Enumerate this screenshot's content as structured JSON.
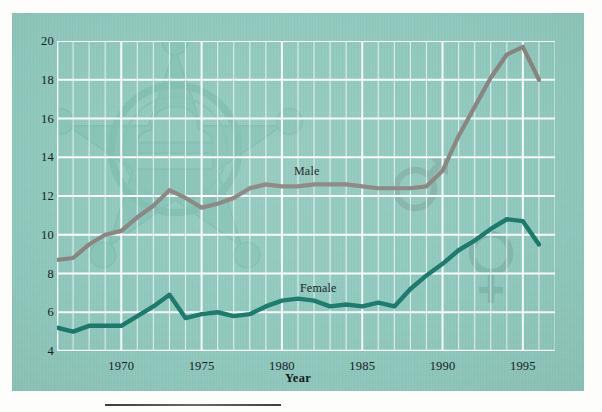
{
  "panel": {
    "background_color": "#8fc9bd",
    "page_background": "#fdfdfb"
  },
  "axis": {
    "x_title": "Year",
    "y_ticks": [
      "4",
      "6",
      "8",
      "10",
      "12",
      "14",
      "16",
      "18",
      "20"
    ],
    "x_ticks": [
      "1970",
      "1975",
      "1980",
      "1985",
      "1990",
      "1995"
    ]
  },
  "series_labels": {
    "male": "Male",
    "female": "Female"
  },
  "watermarks": {
    "badge": "sheriff-star-badge-icon",
    "male_symbol": "male-gender-symbol-icon",
    "female_symbol": "female-gender-symbol-icon"
  },
  "chart_data": {
    "type": "line",
    "title": "",
    "subtitle": "",
    "xlabel": "Year",
    "ylabel": "",
    "xlim": [
      1966,
      1997
    ],
    "ylim": [
      4,
      20
    ],
    "y_ticks": [
      4,
      6,
      8,
      10,
      12,
      14,
      16,
      18,
      20
    ],
    "x_ticks": [
      1970,
      1975,
      1980,
      1985,
      1990,
      1995
    ],
    "grid": true,
    "grid_color": "#ffffff",
    "minor_x_grid": true,
    "legend": "inline-labels",
    "annotations": [
      {
        "text": "Male",
        "x": 1983,
        "y": 13.1
      },
      {
        "text": "Female",
        "x": 1983.4,
        "y": 7.0
      }
    ],
    "x": [
      1966,
      1967,
      1968,
      1969,
      1970,
      1971,
      1972,
      1973,
      1974,
      1975,
      1976,
      1977,
      1978,
      1979,
      1980,
      1981,
      1982,
      1983,
      1984,
      1985,
      1986,
      1987,
      1988,
      1989,
      1990,
      1991,
      1992,
      1993,
      1994,
      1995,
      1996
    ],
    "series": [
      {
        "name": "Male",
        "color": "#8b8582",
        "values": [
          8.7,
          8.8,
          9.5,
          10.0,
          10.2,
          10.9,
          11.5,
          12.3,
          11.9,
          11.4,
          11.6,
          11.9,
          12.4,
          12.6,
          12.5,
          12.5,
          12.6,
          12.6,
          12.6,
          12.5,
          12.4,
          12.4,
          12.4,
          12.5,
          13.3,
          15.1,
          16.6,
          18.1,
          19.3,
          19.7,
          18.0
        ]
      },
      {
        "name": "Female",
        "color": "#1d7a6c",
        "values": [
          5.2,
          5.0,
          5.3,
          5.3,
          5.3,
          5.8,
          6.3,
          6.9,
          5.7,
          5.9,
          6.0,
          5.8,
          5.9,
          6.3,
          6.6,
          6.7,
          6.6,
          6.3,
          6.4,
          6.3,
          6.5,
          6.3,
          7.2,
          7.9,
          8.5,
          9.2,
          9.7,
          10.3,
          10.8,
          10.7,
          9.5
        ]
      }
    ]
  }
}
